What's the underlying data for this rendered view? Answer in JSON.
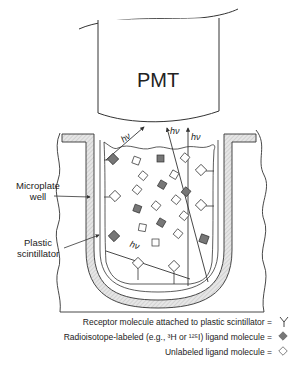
{
  "diagram": {
    "pmt_label": "PMT",
    "photon_label": "hν",
    "labels": {
      "microplate_line1": "Microplate",
      "microplate_line2": "well",
      "scintillator_line1": "Plastic",
      "scintillator_line2": "scintillator"
    },
    "legend": [
      {
        "text": "Receptor molecule attached to plastic scintillator =",
        "icon": "receptor-y-icon"
      },
      {
        "text": "Radioisotope-labeled (e.g., ³H or ¹²⁵I) ligand molecule =",
        "icon": "filled-diamond-icon"
      },
      {
        "text": "Unlabeled ligand molecule =",
        "icon": "open-diamond-icon"
      }
    ],
    "colors": {
      "line": "#333333",
      "hatch": "#d9d9d9",
      "labeled_ligand": "#777777",
      "text": "#222222"
    }
  }
}
